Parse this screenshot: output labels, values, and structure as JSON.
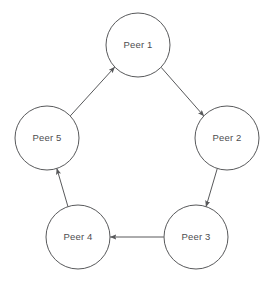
{
  "diagram": {
    "layout": "pentagon-ring",
    "canvas": {
      "width": 275,
      "height": 283
    },
    "colors": {
      "background": "#ffffff",
      "stroke": "#58595b",
      "node_fill": "#ffffff",
      "label_text": "#4d4d4f"
    },
    "nodes": [
      {
        "id": "peer1",
        "label": "Peer 1",
        "cx": 138,
        "cy": 45,
        "r": 32
      },
      {
        "id": "peer2",
        "label": "Peer 2",
        "cx": 227,
        "cy": 138,
        "r": 32
      },
      {
        "id": "peer3",
        "label": "Peer 3",
        "cx": 196,
        "cy": 237,
        "r": 32
      },
      {
        "id": "peer4",
        "label": "Peer 4",
        "cx": 78,
        "cy": 237,
        "r": 32
      },
      {
        "id": "peer5",
        "label": "Peer 5",
        "cx": 47,
        "cy": 138,
        "r": 32
      }
    ],
    "edges": [
      {
        "id": "edge-peer5-peer1",
        "from": "peer5",
        "to": "peer1",
        "direction": "bidirectional"
      },
      {
        "id": "edge-peer1-peer2",
        "from": "peer1",
        "to": "peer2",
        "direction": "bidirectional"
      },
      {
        "id": "edge-peer2-peer3",
        "from": "peer2",
        "to": "peer3",
        "direction": "bidirectional"
      },
      {
        "id": "edge-peer3-peer4",
        "from": "peer3",
        "to": "peer4",
        "direction": "bidirectional"
      },
      {
        "id": "edge-peer4-peer5",
        "from": "peer4",
        "to": "peer5",
        "direction": "bidirectional"
      }
    ]
  }
}
